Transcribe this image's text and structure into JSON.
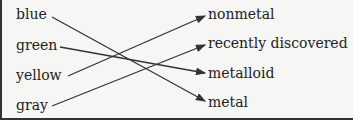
{
  "left_items": [
    {
      "label": "blue",
      "x": 16,
      "y": 7
    },
    {
      "label": "green",
      "x": 16,
      "y": 37
    },
    {
      "label": "yellow",
      "x": 16,
      "y": 67
    },
    {
      "label": "gray",
      "x": 16,
      "y": 97
    }
  ],
  "right_items": [
    {
      "label": "nonmetal",
      "x": 208,
      "y": 6
    },
    {
      "label": "recently discovered",
      "x": 208,
      "y": 35
    },
    {
      "label": "metalloid",
      "x": 208,
      "y": 65
    },
    {
      "label": "metal",
      "x": 208,
      "y": 94
    }
  ],
  "connections": [
    {
      "from": "blue",
      "to": "metal"
    },
    {
      "from": "green",
      "to": "metalloid"
    },
    {
      "from": "yellow",
      "to": "nonmetal"
    },
    {
      "from": "gray",
      "to": "recently discovered"
    }
  ]
}
